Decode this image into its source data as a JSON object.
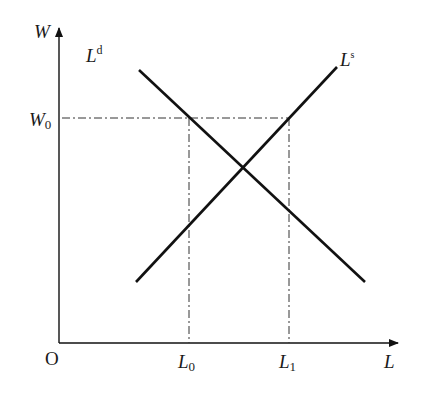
{
  "diagram": {
    "type": "labor-market-supply-demand",
    "y_axis": {
      "label": "W",
      "level_label": "W",
      "level_subscript": "0"
    },
    "x_axis": {
      "label": "L",
      "origin_label": "O",
      "ticks": [
        {
          "label": "L",
          "subscript": "0"
        },
        {
          "label": "L",
          "subscript": "1"
        }
      ]
    },
    "curves": [
      {
        "name": "demand",
        "label": "L",
        "superscript": "d"
      },
      {
        "name": "supply",
        "label": "L",
        "superscript": "s"
      }
    ],
    "colors": {
      "line": "#111111",
      "guide": "#333333",
      "background": "#ffffff"
    }
  }
}
